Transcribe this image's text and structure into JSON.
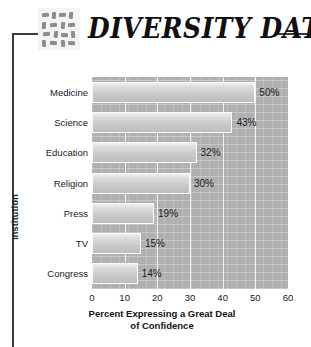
{
  "header": {
    "title": "DIVERSITY DATA",
    "logo_icon": "grid-pattern-icon"
  },
  "chart_data": {
    "type": "bar",
    "orientation": "horizontal",
    "title": "DIVERSITY DATA",
    "categories": [
      "Medicine",
      "Science",
      "Education",
      "Religion",
      "Press",
      "TV",
      "Congress"
    ],
    "values": [
      50,
      43,
      32,
      30,
      19,
      15,
      14
    ],
    "value_labels": [
      "50%",
      "43%",
      "32%",
      "30%",
      "19%",
      "15%",
      "14%"
    ],
    "xlabel": "Percent Expressing a Great Deal of Confidence",
    "xlabel_line1": "Percent Expressing a Great Deal",
    "xlabel_line2": "of Confidence",
    "ylabel": "Institution",
    "xlim": [
      0,
      60
    ],
    "xticks": [
      0,
      10,
      20,
      30,
      40,
      50,
      60
    ],
    "xtick_labels": [
      "0",
      "10",
      "20",
      "30",
      "40",
      "50",
      "60"
    ],
    "grid": true,
    "legend": false,
    "colors": {
      "plot_background": "#b0b0b0",
      "bar_fill": "#d2d2d2",
      "bar_edge": "#fbfbfb",
      "text": "#17171a",
      "frame": "#3a3a3c"
    }
  }
}
